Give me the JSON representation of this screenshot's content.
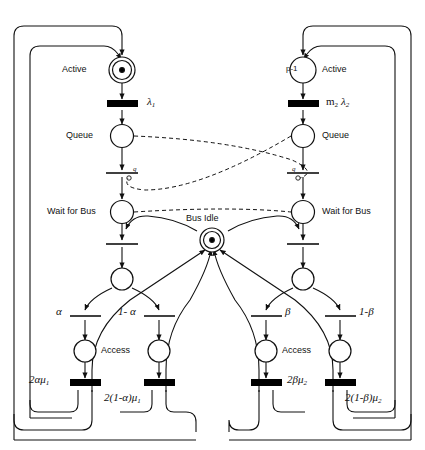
{
  "diagram": {
    "type": "petri-net",
    "stroke_color": "#111111",
    "fill_color": "#000000",
    "background": "#ffffff"
  },
  "places": {
    "left_active": {
      "label": "Active",
      "marking": "1 token",
      "double": true
    },
    "left_queue": {
      "label": "Queue",
      "marking": "",
      "double": false
    },
    "left_wait": {
      "label": "Wait for Bus",
      "marking": "",
      "double": false
    },
    "left_mid": {
      "label": "",
      "marking": "",
      "double": false
    },
    "left_access_a": {
      "label": "Access",
      "marking": "",
      "double": false
    },
    "left_access_b": {
      "label": "",
      "marking": "",
      "double": false
    },
    "bus_idle": {
      "label": "Bus Idle",
      "marking": "1 token",
      "double": true
    },
    "right_active": {
      "label": "Active",
      "marking": "p -1",
      "double": false
    },
    "right_queue": {
      "label": "Queue",
      "marking": "",
      "double": false
    },
    "right_wait": {
      "label": "Wait for Bus",
      "marking": "",
      "double": false
    },
    "right_mid": {
      "label": "",
      "marking": "",
      "double": false
    },
    "right_access_a": {
      "label": "Access",
      "marking": "",
      "double": false
    },
    "right_access_b": {
      "label": "",
      "marking": "",
      "double": false
    }
  },
  "transitions": {
    "left_lambda": {
      "label": "λ",
      "sub": "1",
      "kind": "timed"
    },
    "left_q": {
      "label": "q",
      "kind": "immediate"
    },
    "left_bus_grab": {
      "label": "",
      "kind": "immediate"
    },
    "left_alpha": {
      "label": "α",
      "kind": "immediate"
    },
    "left_one_minus_alpha": {
      "label": "1- α",
      "kind": "immediate"
    },
    "left_rate_a": {
      "label": "2αμ",
      "sub": "1",
      "kind": "timed"
    },
    "left_rate_b": {
      "label": "2(1-α)μ",
      "sub": "1",
      "kind": "timed"
    },
    "right_lambda": {
      "label": "m",
      "sub": "2",
      "label2": "λ",
      "sub2": "2",
      "kind": "timed"
    },
    "right_q": {
      "label": "q",
      "kind": "immediate"
    },
    "right_bus_grab": {
      "label": "",
      "kind": "immediate"
    },
    "right_beta": {
      "label": "β",
      "kind": "immediate"
    },
    "right_one_minus_beta": {
      "label": "1-β",
      "kind": "immediate"
    },
    "right_rate_a": {
      "label": "2βμ",
      "sub": "2",
      "kind": "timed"
    },
    "right_rate_b": {
      "label": "2(1-β)μ",
      "sub": "2",
      "kind": "timed"
    }
  },
  "labels": {
    "active_left": "Active",
    "queue_left": "Queue",
    "wait_left": "Wait for Bus",
    "access_left": "Access",
    "active_right": "Active",
    "queue_right": "Queue",
    "wait_right": "Wait for Bus",
    "access_right": "Access",
    "bus_idle": "Bus Idle",
    "p_minus_1_bold": "p",
    "p_minus_1_rest": "-1",
    "lambda1_main": "λ",
    "lambda1_sub": "1",
    "m2_main": "m",
    "m2_sub": "2",
    "lambda2_main": "λ",
    "lambda2_sub": "2",
    "alpha": "α",
    "one_minus_alpha": "1- α",
    "beta": "β",
    "one_minus_beta": "1-β",
    "rate_2alpha_mu": "2αμ",
    "rate_2alpha_mu_sub": "1",
    "rate_2_1malpha_mu": "2(1-α)μ",
    "rate_2_1malpha_mu_sub": "1",
    "rate_2beta_mu": "2βμ",
    "rate_2beta_mu_sub": "2",
    "rate_2_1mbeta_mu": "2(1-β)μ",
    "rate_2_1mbeta_mu_sub": "2",
    "q_left": "q",
    "q_right": "q"
  },
  "arcs": {
    "inhibitor_style": "dashed",
    "normal_style": "solid"
  }
}
